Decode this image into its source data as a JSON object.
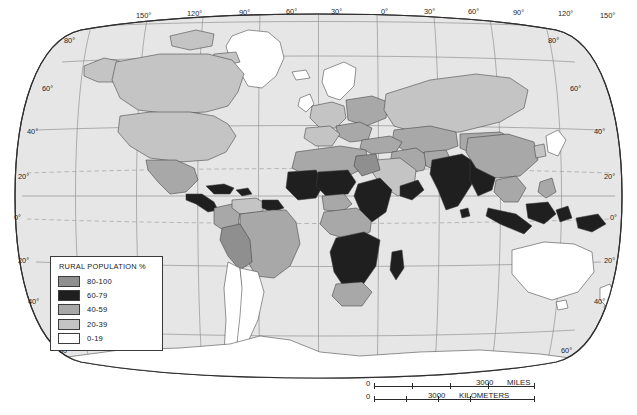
{
  "map": {
    "projection": "robinson",
    "title": "World Rural Population Percentage Map",
    "ocean_color": "#e6e6e6",
    "background_color": "#ffffff",
    "graticule_color": "#8a8a8a",
    "tropic_line_color": "#9a9a9a",
    "border_color": "#3a3a3a",
    "coast_color": "#4a4a4a"
  },
  "legend": {
    "title": "RURAL POPULATION %",
    "items": [
      {
        "label": "80-100",
        "color": "#8f8f8f"
      },
      {
        "label": "60-79",
        "color": "#1f1f1f"
      },
      {
        "label": "40-59",
        "color": "#a8a8a8"
      },
      {
        "label": "20-39",
        "color": "#c4c4c4"
      },
      {
        "label": "0-19",
        "color": "#ffffff"
      }
    ]
  },
  "scale": {
    "miles": {
      "zero": "0",
      "value": "3000",
      "unit": "MILES"
    },
    "kilometers": {
      "zero": "0",
      "value": "3000",
      "unit": "KILOMETERS"
    }
  },
  "graticule": {
    "longitude_top": [
      "150°",
      "120°",
      "90°",
      "60°",
      "30°",
      "0°",
      "30°",
      "60°",
      "90°",
      "120°",
      "150°"
    ],
    "latitude_left": [
      "80°",
      "60°",
      "40°",
      "20°",
      "0°",
      "20°",
      "40°",
      "60°"
    ],
    "latitude_right": [
      "80°",
      "60°",
      "40°",
      "20°",
      "0°",
      "20°",
      "40°",
      "60°"
    ]
  },
  "regions": [
    {
      "name": "greenland",
      "class": "c0"
    },
    {
      "name": "canada",
      "class": "c20"
    },
    {
      "name": "united-states",
      "class": "c20"
    },
    {
      "name": "mexico",
      "class": "c40"
    },
    {
      "name": "central-america",
      "class": "c60"
    },
    {
      "name": "caribbean",
      "class": "c60"
    },
    {
      "name": "colombia",
      "class": "c40"
    },
    {
      "name": "venezuela",
      "class": "c20"
    },
    {
      "name": "guyanas",
      "class": "c60"
    },
    {
      "name": "brazil",
      "class": "c40"
    },
    {
      "name": "peru-bolivia",
      "class": "c80"
    },
    {
      "name": "chile",
      "class": "c0"
    },
    {
      "name": "argentina",
      "class": "c0"
    },
    {
      "name": "iceland",
      "class": "c0"
    },
    {
      "name": "scandinavia",
      "class": "c0"
    },
    {
      "name": "british-isles",
      "class": "c0"
    },
    {
      "name": "western-europe",
      "class": "c20"
    },
    {
      "name": "eastern-europe",
      "class": "c40"
    },
    {
      "name": "balkans",
      "class": "c40"
    },
    {
      "name": "russia",
      "class": "c20"
    },
    {
      "name": "turkey",
      "class": "c40"
    },
    {
      "name": "middle-east",
      "class": "c40"
    },
    {
      "name": "arabia",
      "class": "c20"
    },
    {
      "name": "yemen-oman",
      "class": "c60"
    },
    {
      "name": "north-africa",
      "class": "c40"
    },
    {
      "name": "egypt",
      "class": "c80"
    },
    {
      "name": "sahel",
      "class": "c60"
    },
    {
      "name": "west-africa",
      "class": "c60"
    },
    {
      "name": "nigeria",
      "class": "c40"
    },
    {
      "name": "central-africa",
      "class": "c40"
    },
    {
      "name": "east-africa",
      "class": "c60"
    },
    {
      "name": "southern-africa",
      "class": "c60"
    },
    {
      "name": "south-africa",
      "class": "c40"
    },
    {
      "name": "madagascar",
      "class": "c60"
    },
    {
      "name": "india",
      "class": "c60"
    },
    {
      "name": "pakistan",
      "class": "c40"
    },
    {
      "name": "central-asia",
      "class": "c40"
    },
    {
      "name": "china",
      "class": "c40"
    },
    {
      "name": "mongolia",
      "class": "c40"
    },
    {
      "name": "japan",
      "class": "c0"
    },
    {
      "name": "korea",
      "class": "c20"
    },
    {
      "name": "southeast-asia",
      "class": "c60"
    },
    {
      "name": "indonesia",
      "class": "c60"
    },
    {
      "name": "philippines",
      "class": "c40"
    },
    {
      "name": "australia",
      "class": "c0"
    },
    {
      "name": "new-zealand",
      "class": "c0"
    },
    {
      "name": "papua-new-guinea",
      "class": "c60"
    },
    {
      "name": "antarctica",
      "class": "c0"
    }
  ]
}
